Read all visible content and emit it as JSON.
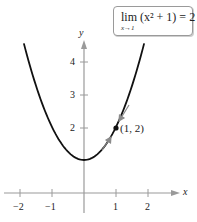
{
  "chart_data": {
    "type": "line",
    "function": "f(x) = x^2 + 1",
    "title": "",
    "annotation_box": "lim (x^2 + 1) = 2 as x→1",
    "xlabel": "x",
    "ylabel": "y",
    "xlim": [
      -2.5,
      3.2
    ],
    "ylim": [
      -0.5,
      4.9
    ],
    "x_ticks": [
      -2,
      -1,
      1,
      2
    ],
    "x_tick_labels": [
      "−2",
      "−1",
      "1",
      "2"
    ],
    "y_ticks": [
      2,
      3,
      4
    ],
    "y_tick_labels": [
      "2",
      "3",
      "4"
    ],
    "grid": false,
    "series": [
      {
        "name": "y = x^2 + 1",
        "x": [
          -1.87,
          -1.5,
          -1.0,
          -0.5,
          0,
          0.5,
          1.0,
          1.5,
          1.87
        ],
        "y": [
          4.5,
          3.25,
          2.0,
          1.25,
          1.0,
          1.25,
          2.0,
          3.25,
          4.5
        ]
      }
    ],
    "highlighted_point": {
      "x": 1,
      "y": 2,
      "label": "(1, 2)"
    },
    "approach_arrows": [
      {
        "from": "above-right along curve",
        "toward": [
          1,
          2
        ]
      },
      {
        "from": "below-left along curve",
        "toward": [
          1,
          2
        ]
      }
    ]
  },
  "limit_box": {
    "main": "lim (x² + 1) = 2",
    "subscript": "x→1"
  },
  "axes": {
    "x_name": "x",
    "y_name": "y"
  },
  "point_label": "(1, 2)",
  "colors": {
    "curve": "#111111",
    "axes": "#9a9a9a",
    "arrows": "#8a8a8a",
    "point": "#111111"
  }
}
